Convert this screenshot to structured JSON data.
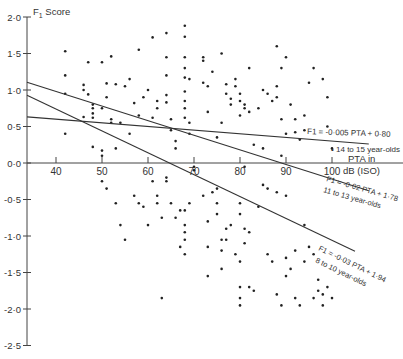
{
  "chart_data": {
    "type": "scatter",
    "title": "",
    "ylabel": "F1 Score",
    "xlabel": "PTA in dB (ISO)",
    "xlabel_lines": [
      "PTA in",
      "dB (ISO)"
    ],
    "xlim": [
      34,
      108
    ],
    "ylim": [
      -2.5,
      2.0
    ],
    "xticks": [
      40,
      50,
      60,
      70,
      80,
      90,
      100
    ],
    "yticks": [
      2.0,
      1.5,
      1.0,
      0.5,
      0.0,
      -0.5,
      -1.0,
      -1.5,
      -2.0,
      -2.5
    ],
    "ytick_labels": [
      "2·0",
      "1·5",
      "1·0",
      "0·5",
      "0·0",
      "-0·5",
      "-1·0",
      "-1·5",
      "-2·0",
      "-2·5"
    ],
    "grid": false,
    "regression_lines": [
      {
        "name": "14 to 15 year-olds",
        "equation": "F1 = -0·005 PTA + 0·80",
        "slope": -0.005,
        "intercept": 0.8,
        "x_range": [
          34,
          108
        ]
      },
      {
        "name": "11 to 13 year-olds",
        "equation": "F1 = -0·02 PTA + 1·78",
        "slope": -0.02,
        "intercept": 1.78,
        "x_range": [
          34,
          108
        ]
      },
      {
        "name": "8 to 10 year-olds",
        "equation": "F1 = -0·03 PTA + 1·94",
        "slope": -0.03,
        "intercept": 1.94,
        "x_range": [
          34,
          108
        ]
      }
    ],
    "points": [
      [
        42,
        1.53
      ],
      [
        42,
        1.2
      ],
      [
        42,
        0.95
      ],
      [
        42,
        0.4
      ],
      [
        46,
        1.0
      ],
      [
        46,
        1.07
      ],
      [
        47,
        1.38
      ],
      [
        47,
        0.94
      ],
      [
        48,
        0.8
      ],
      [
        48,
        0.75
      ],
      [
        48,
        0.68
      ],
      [
        48,
        0.62
      ],
      [
        50,
        1.38
      ],
      [
        50,
        0.75
      ],
      [
        51,
        1.09
      ],
      [
        51,
        0.9
      ],
      [
        52,
        1.46
      ],
      [
        52,
        0.6
      ],
      [
        52,
        0.55
      ],
      [
        46,
        0.63
      ],
      [
        48,
        0.22
      ],
      [
        50,
        0.17
      ],
      [
        50,
        0.1
      ],
      [
        53,
        0.2
      ],
      [
        56,
        0.4
      ],
      [
        54,
        0.55
      ],
      [
        53,
        1.08
      ],
      [
        55,
        1.05
      ],
      [
        56,
        1.15
      ],
      [
        57,
        0.82
      ],
      [
        58,
        1.55
      ],
      [
        58,
        0.65
      ],
      [
        59,
        0.9
      ],
      [
        60,
        1.0
      ],
      [
        61,
        1.72
      ],
      [
        61,
        0.62
      ],
      [
        62,
        0.85
      ],
      [
        62,
        0.75
      ],
      [
        64,
        1.78
      ],
      [
        64,
        1.45
      ],
      [
        64,
        1.2
      ],
      [
        64,
        0.93
      ],
      [
        64,
        0.83
      ],
      [
        65,
        0.6
      ],
      [
        65,
        0.45
      ],
      [
        66,
        0.3
      ],
      [
        66,
        0.2
      ],
      [
        68,
        1.88
      ],
      [
        68,
        1.73
      ],
      [
        68,
        1.45
      ],
      [
        68,
        1.3
      ],
      [
        68,
        1.17
      ],
      [
        69,
        1.15
      ],
      [
        68,
        0.98
      ],
      [
        68,
        0.85
      ],
      [
        68,
        0.75
      ],
      [
        68,
        0.62
      ],
      [
        69,
        0.4
      ],
      [
        69,
        0.55
      ],
      [
        72,
        1.45
      ],
      [
        72,
        1.4
      ],
      [
        72,
        1.1
      ],
      [
        73,
        1.05
      ],
      [
        73,
        0.7
      ],
      [
        74,
        1.25
      ],
      [
        75,
        0.35
      ],
      [
        76,
        0.55
      ],
      [
        76,
        1.5
      ],
      [
        77,
        1.08
      ],
      [
        77,
        0.95
      ],
      [
        78,
        0.88
      ],
      [
        78,
        0.8
      ],
      [
        79,
        1.15
      ],
      [
        79,
        1.05
      ],
      [
        80,
        0.95
      ],
      [
        80,
        0.85
      ],
      [
        80,
        0.65
      ],
      [
        81,
        0.8
      ],
      [
        81,
        0.75
      ],
      [
        82,
        1.3
      ],
      [
        82,
        0.7
      ],
      [
        84,
        0.75
      ],
      [
        85,
        1.0
      ],
      [
        86,
        0.95
      ],
      [
        87,
        0.85
      ],
      [
        88,
        1.6
      ],
      [
        88,
        1.05
      ],
      [
        88,
        0.9
      ],
      [
        89,
        1.3
      ],
      [
        89,
        0.6
      ],
      [
        90,
        1.45
      ],
      [
        90,
        0.4
      ],
      [
        91,
        0.8
      ],
      [
        92,
        0.6
      ],
      [
        92,
        0.42
      ],
      [
        93,
        0.32
      ],
      [
        83,
        0.25
      ],
      [
        85,
        0.2
      ],
      [
        89,
        0.1
      ],
      [
        94,
        0.65
      ],
      [
        94,
        0.45
      ],
      [
        95,
        1.1
      ],
      [
        96,
        1.3
      ],
      [
        98,
        1.15
      ],
      [
        99,
        0.9
      ],
      [
        99,
        0.5
      ],
      [
        100,
        0.2
      ],
      [
        50,
        -0.25
      ],
      [
        51,
        -0.35
      ],
      [
        53,
        -0.55
      ],
      [
        54,
        -0.85
      ],
      [
        55,
        -1.05
      ],
      [
        57,
        -0.45
      ],
      [
        58,
        -0.55
      ],
      [
        59,
        -0.6
      ],
      [
        60,
        -0.85
      ],
      [
        61,
        -0.25
      ],
      [
        62,
        -0.45
      ],
      [
        62,
        -0.55
      ],
      [
        63,
        -0.75
      ],
      [
        63,
        -1.85
      ],
      [
        64,
        -0.2
      ],
      [
        64,
        -0.25
      ],
      [
        65,
        -0.55
      ],
      [
        66,
        -0.75
      ],
      [
        67,
        -0.65
      ],
      [
        67,
        -1.15
      ],
      [
        68,
        -0.65
      ],
      [
        68,
        -0.85
      ],
      [
        68,
        -0.95
      ],
      [
        68,
        -1.05
      ],
      [
        68,
        -1.25
      ],
      [
        69,
        -0.55
      ],
      [
        70,
        -0.05
      ],
      [
        70,
        -0.1
      ],
      [
        72,
        -0.45
      ],
      [
        73,
        -0.8
      ],
      [
        73,
        -1.15
      ],
      [
        73,
        -1.55
      ],
      [
        74,
        -0.4
      ],
      [
        75,
        -0.35
      ],
      [
        75,
        -0.55
      ],
      [
        75,
        -0.7
      ],
      [
        76,
        -1.05
      ],
      [
        76,
        -1.2
      ],
      [
        76,
        -1.45
      ],
      [
        77,
        -0.9
      ],
      [
        77,
        -1.05
      ],
      [
        78,
        -0.85
      ],
      [
        79,
        -1.25
      ],
      [
        80,
        -0.55
      ],
      [
        80,
        -0.7
      ],
      [
        80,
        -1.35
      ],
      [
        80,
        -1.7
      ],
      [
        80,
        -1.85
      ],
      [
        80,
        -1.95
      ],
      [
        81,
        -0.05
      ],
      [
        81,
        -0.9
      ],
      [
        81,
        -1.1
      ],
      [
        82,
        -0.95
      ],
      [
        82,
        -1.7
      ],
      [
        83,
        -1.75
      ],
      [
        84,
        -0.6
      ],
      [
        85,
        -0.3
      ],
      [
        86,
        -0.35
      ],
      [
        86,
        -1.25
      ],
      [
        87,
        -1.35
      ],
      [
        88,
        -0.4
      ],
      [
        88,
        -1.8
      ],
      [
        89,
        -1.95
      ],
      [
        90,
        -0.45
      ],
      [
        90,
        -1.3
      ],
      [
        90,
        -1.55
      ],
      [
        91,
        -1.45
      ],
      [
        92,
        -1.2
      ],
      [
        92,
        -1.85
      ],
      [
        93,
        -1.95
      ],
      [
        94,
        -0.85
      ],
      [
        94,
        -1.35
      ],
      [
        95,
        -1.15
      ],
      [
        96,
        -1.25
      ],
      [
        96,
        -1.85
      ],
      [
        97,
        -1.6
      ],
      [
        97,
        -1.75
      ],
      [
        98,
        -1.8
      ],
      [
        98,
        -1.95
      ],
      [
        99,
        -1.7
      ],
      [
        100,
        -1.85
      ]
    ],
    "annotations": [
      {
        "text": "14 to 15 year-olds",
        "near": [
          100,
          0.2
        ]
      },
      {
        "text": "11 to 13 year-olds",
        "near": [
          100,
          -0.3
        ]
      },
      {
        "text": "8 to 10 year-olds",
        "near": [
          100,
          -1.1
        ]
      }
    ],
    "legend_position": "none"
  }
}
